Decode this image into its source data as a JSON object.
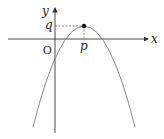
{
  "diagram": {
    "type": "parabola-graph",
    "labels": {
      "x_axis": "x",
      "y_axis": "y",
      "origin": "O",
      "vertex_x": "p",
      "vertex_y": "q"
    },
    "colors": {
      "axis": "#333333",
      "curve": "#888888",
      "dashed": "#555555",
      "vertex": "#111111"
    }
  }
}
